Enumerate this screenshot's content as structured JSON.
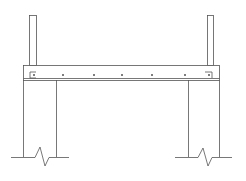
{
  "diagram": {
    "title": "",
    "colors": {
      "line": "#555555",
      "background": "#ffffff"
    },
    "beam": {
      "x": 23,
      "y": 65,
      "width": 196,
      "height": 15,
      "inner_line_y": 78
    },
    "posts": [
      {
        "x": 29,
        "y": 15,
        "width": 7,
        "height": 50
      },
      {
        "x": 207,
        "y": 15,
        "width": 6,
        "height": 50
      }
    ],
    "columns": [
      {
        "left": 23,
        "right": 56,
        "top": 80,
        "bottom": 157
      },
      {
        "left": 188,
        "right": 219,
        "top": 80,
        "bottom": 157
      }
    ],
    "rebar_dots": [
      34,
      63,
      94,
      122,
      152,
      185,
      209
    ],
    "rebar_y": 75,
    "ground_y": 157
  }
}
